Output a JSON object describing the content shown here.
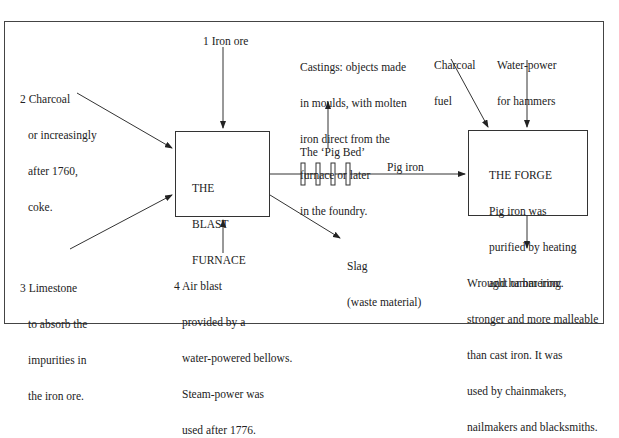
{
  "diagram": {
    "nodes": {
      "blast_furnace": {
        "lines": [
          "THE",
          "BLAST",
          "FURNACE"
        ]
      },
      "forge": {
        "lines": [
          "THE FORGE",
          "Pig iron was",
          "purified by heating",
          "and hammering."
        ]
      }
    },
    "inputs": {
      "iron_ore": "1 Iron ore",
      "charcoal": [
        "2 Charcoal",
        "or increasingly",
        "after 1760,",
        "coke."
      ],
      "limestone": [
        "3 Limestone",
        "to absorb the",
        "impurities in",
        "the iron ore."
      ],
      "air_blast": [
        "4 Air blast",
        "provided by a",
        "water-powered bellows.",
        "Steam-power was",
        "used after 1776."
      ],
      "forge_charcoal": [
        "Charcoal",
        "fuel"
      ],
      "forge_water": [
        "Water-power",
        "for hammers"
      ]
    },
    "outputs": {
      "castings": [
        "Castings: objects made",
        "in moulds, with molten",
        "iron direct from the",
        "furnace or later",
        "in the foundry."
      ],
      "pig_bed": "The ‘Pig Bed’",
      "pig_iron": "Pig iron",
      "slag": [
        "Slag",
        "(waste material)"
      ],
      "wrought_iron": [
        "Wrought or bar iron:",
        "stronger and more malleable",
        "than cast iron. It was",
        "used by chainmakers,",
        "nailmakers and blacksmiths."
      ]
    },
    "edges": [
      {
        "from": "1 Iron ore",
        "to": "THE BLAST FURNACE"
      },
      {
        "from": "2 Charcoal",
        "to": "THE BLAST FURNACE"
      },
      {
        "from": "3 Limestone",
        "to": "THE BLAST FURNACE"
      },
      {
        "from": "4 Air blast",
        "to": "THE BLAST FURNACE"
      },
      {
        "from": "THE BLAST FURNACE",
        "to": "Slag"
      },
      {
        "from": "THE BLAST FURNACE",
        "to": "Pig iron / THE FORGE",
        "via": "The 'Pig Bed'"
      },
      {
        "from": "The 'Pig Bed'",
        "to": "Castings"
      },
      {
        "from": "Charcoal fuel",
        "to": "THE FORGE"
      },
      {
        "from": "Water-power for hammers",
        "to": "THE FORGE"
      },
      {
        "from": "THE FORGE",
        "to": "Wrought or bar iron"
      }
    ]
  }
}
